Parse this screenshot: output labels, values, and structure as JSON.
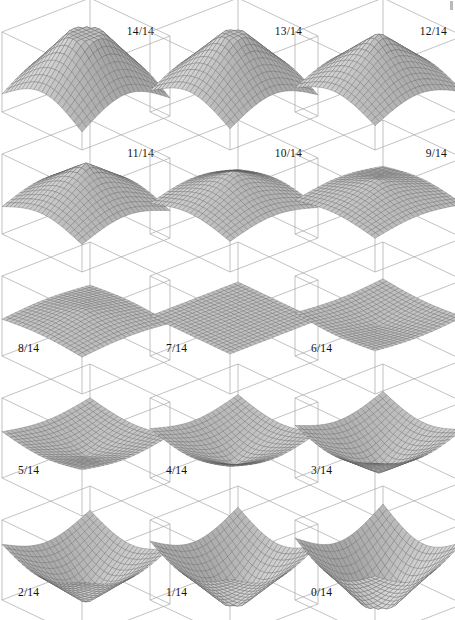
{
  "figure": {
    "grid": {
      "rows": 5,
      "cols": 3,
      "panel_count": 15
    },
    "projection": {
      "type": "axonometric-box",
      "box_aspect": "cube"
    },
    "style": {
      "background": "#ffffff",
      "box_line_color": "#a8a8a8",
      "mesh_line_color": "#5a5a5a",
      "mesh_fill_color": "#ffffff",
      "mesh_shade_dark": "#8c8c8c",
      "label_color": "#111111"
    },
    "corner_artifact": {
      "visible": true,
      "color": "#b9b9b9"
    }
  },
  "chart_data": {
    "type": "surface-grid",
    "subtitle": "",
    "xlabel": "",
    "ylabel": "",
    "zlabel": "",
    "grid_rows": 5,
    "grid_cols": 3,
    "mesh_resolution": 20,
    "zlim": [
      -1,
      1
    ],
    "parameter_name": "t",
    "parameter_values": [
      1.0,
      0.9286,
      0.8571,
      0.7857,
      0.7143,
      0.6429,
      0.5714,
      0.5,
      0.4286,
      0.3571,
      0.2857,
      0.2143,
      0.1429,
      0.0714,
      0.0
    ],
    "panels": [
      {
        "index": 0,
        "label": "14/14",
        "numerator": 14,
        "denominator": 14,
        "t": 1.0,
        "amplitude": 1.0,
        "shape": "peak",
        "label_position": "top-right",
        "row": 0,
        "col": 0
      },
      {
        "index": 1,
        "label": "13/14",
        "numerator": 13,
        "denominator": 14,
        "t": 0.9286,
        "amplitude": 0.8571,
        "shape": "peak",
        "label_position": "top-right",
        "row": 0,
        "col": 1
      },
      {
        "index": 2,
        "label": "12/14",
        "numerator": 12,
        "denominator": 14,
        "t": 0.8571,
        "amplitude": 0.7143,
        "shape": "peak",
        "label_position": "top-right",
        "row": 0,
        "col": 2
      },
      {
        "index": 3,
        "label": "11/14",
        "numerator": 11,
        "denominator": 14,
        "t": 0.7857,
        "amplitude": 0.5714,
        "shape": "peak",
        "label_position": "top-right",
        "row": 1,
        "col": 0
      },
      {
        "index": 4,
        "label": "10/14",
        "numerator": 10,
        "denominator": 14,
        "t": 0.7143,
        "amplitude": 0.4286,
        "shape": "peak",
        "label_position": "top-right",
        "row": 1,
        "col": 1
      },
      {
        "index": 5,
        "label": "9/14",
        "numerator": 9,
        "denominator": 14,
        "t": 0.6429,
        "amplitude": 0.2857,
        "shape": "peak",
        "label_position": "top-right",
        "row": 1,
        "col": 2
      },
      {
        "index": 6,
        "label": "8/14",
        "numerator": 8,
        "denominator": 14,
        "t": 0.5714,
        "amplitude": 0.1429,
        "shape": "shallow-peak",
        "label_position": "bottom-left",
        "row": 2,
        "col": 0
      },
      {
        "index": 7,
        "label": "7/14",
        "numerator": 7,
        "denominator": 14,
        "t": 0.5,
        "amplitude": 0.0,
        "shape": "flat-plane",
        "label_position": "bottom-left",
        "row": 2,
        "col": 1
      },
      {
        "index": 8,
        "label": "6/14",
        "numerator": 6,
        "denominator": 14,
        "t": 0.4286,
        "amplitude": -0.1429,
        "shape": "shallow-well",
        "label_position": "bottom-left",
        "row": 2,
        "col": 2
      },
      {
        "index": 9,
        "label": "5/14",
        "numerator": 5,
        "denominator": 14,
        "t": 0.3571,
        "amplitude": -0.2857,
        "shape": "well",
        "label_position": "bottom-left",
        "row": 3,
        "col": 0
      },
      {
        "index": 10,
        "label": "4/14",
        "numerator": 4,
        "denominator": 14,
        "t": 0.2857,
        "amplitude": -0.4286,
        "shape": "well",
        "label_position": "bottom-left",
        "row": 3,
        "col": 1
      },
      {
        "index": 11,
        "label": "3/14",
        "numerator": 3,
        "denominator": 14,
        "t": 0.2143,
        "amplitude": -0.5714,
        "shape": "well",
        "label_position": "bottom-left",
        "row": 3,
        "col": 2
      },
      {
        "index": 12,
        "label": "2/14",
        "numerator": 2,
        "denominator": 14,
        "t": 0.1429,
        "amplitude": -0.7143,
        "shape": "deep-well",
        "label_position": "bottom-left",
        "row": 4,
        "col": 0
      },
      {
        "index": 13,
        "label": "1/14",
        "numerator": 1,
        "denominator": 14,
        "t": 0.0714,
        "amplitude": -0.8571,
        "shape": "deep-well",
        "label_position": "bottom-left",
        "row": 4,
        "col": 1
      },
      {
        "index": 14,
        "label": "0/14",
        "numerator": 0,
        "denominator": 14,
        "t": 0.0,
        "amplitude": -1.0,
        "shape": "inverted-cone",
        "label_position": "bottom-left",
        "row": 4,
        "col": 2
      }
    ]
  }
}
